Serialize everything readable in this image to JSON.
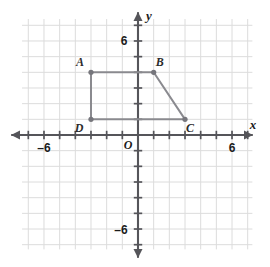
{
  "figure": {
    "background_color": "#ffffff",
    "grid_color": "#dcdcdc",
    "axis_color": "#55555a",
    "shape_color": "#8a8a8f",
    "vertex_color": "#76767c",
    "text_color": "#1b1b1b"
  },
  "axes": {
    "x_axis_label": "x",
    "y_axis_label": "y",
    "origin_label": "O",
    "x_tick_labels": [
      {
        "text": "–6",
        "value": -6
      },
      {
        "text": "6",
        "value": 6
      }
    ],
    "y_tick_labels": [
      {
        "text": "6",
        "value": 6
      },
      {
        "text": "–6",
        "value": -6
      }
    ],
    "x_range": [
      -7.4,
      7.3
    ],
    "y_range": [
      -7.3,
      7.4
    ],
    "tick_interval": 1,
    "grid_interval": 1
  },
  "chart_data": {
    "type": "scatter",
    "xlabel": "x",
    "ylabel": "y",
    "xlim": [
      -7.4,
      7.3
    ],
    "ylim": [
      -7.3,
      7.4
    ],
    "grid": true,
    "legend": "none",
    "xticks": [
      -6,
      6
    ],
    "yticks": [
      -6,
      6
    ],
    "points": [
      {
        "label": "A",
        "x": -3,
        "y": 4
      },
      {
        "label": "B",
        "x": 1,
        "y": 4
      },
      {
        "label": "C",
        "x": 3,
        "y": 1
      },
      {
        "label": "D",
        "x": -3,
        "y": 1
      }
    ],
    "polygon_order": [
      "A",
      "B",
      "C",
      "D"
    ],
    "edges": [
      {
        "from": "A",
        "to": "B"
      },
      {
        "from": "B",
        "to": "C"
      },
      {
        "from": "C",
        "to": "D"
      },
      {
        "from": "D",
        "to": "A"
      }
    ],
    "label_offsets": [
      {
        "label": "A",
        "dx": -11,
        "dy": -6
      },
      {
        "label": "B",
        "dx": 6,
        "dy": -6
      },
      {
        "label": "C",
        "dx": 5,
        "dy": 13
      },
      {
        "label": "D",
        "dx": -12,
        "dy": 13
      }
    ]
  }
}
